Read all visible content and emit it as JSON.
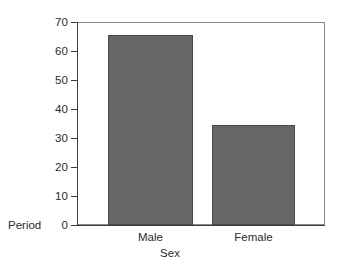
{
  "chart_data": {
    "type": "bar",
    "title": "",
    "subtitle": "",
    "categories": [
      "Male",
      "Female"
    ],
    "values": [
      65.5,
      34.5
    ],
    "series": [
      {
        "name": "Period",
        "values": [
          65.5,
          34.5
        ]
      }
    ],
    "xlabel": "Sex",
    "ylabel": "Period",
    "ylim": [
      0,
      70
    ],
    "yticks": [
      70,
      60,
      50,
      40,
      30,
      20,
      10,
      0
    ],
    "ytick_labels": [
      "70",
      "60",
      "50",
      "40",
      "30",
      "20",
      "10",
      "0"
    ],
    "xtick_labels": [
      "Male",
      "Female"
    ],
    "grid": false,
    "legend": false,
    "legend_position": "none",
    "annotations": [],
    "colors": {
      "bar_fill": "#666666",
      "bar_edge": "#4a4a4a",
      "axis": "#3d3d3d",
      "frame": "#8a8a8a",
      "background": "#ffffff",
      "text": "#2b2b2b"
    }
  },
  "axes": {
    "y_title": "Period",
    "x_title": "Sex"
  }
}
